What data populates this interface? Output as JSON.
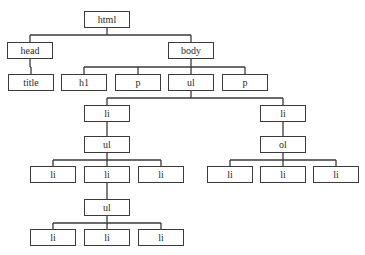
{
  "diagram": {
    "type": "tree",
    "title": "",
    "colors": {
      "stroke": "#3a3a3a",
      "fill": "#ffffff",
      "text": "#2a2a2a"
    },
    "nodes": [
      {
        "id": "html",
        "label": "html",
        "x": 84,
        "y": 11
      },
      {
        "id": "head",
        "label": "head",
        "x": 7,
        "y": 42
      },
      {
        "id": "body",
        "label": "body",
        "x": 168,
        "y": 42
      },
      {
        "id": "title",
        "label": "title",
        "x": 8,
        "y": 74
      },
      {
        "id": "h1",
        "label": "h1",
        "x": 61,
        "y": 74
      },
      {
        "id": "p1",
        "label": "p",
        "x": 115,
        "y": 74
      },
      {
        "id": "ul1",
        "label": "ul",
        "x": 168,
        "y": 74
      },
      {
        "id": "p2",
        "label": "p",
        "x": 222,
        "y": 74
      },
      {
        "id": "li_a",
        "label": "li",
        "x": 84,
        "y": 105
      },
      {
        "id": "li_b",
        "label": "li",
        "x": 260,
        "y": 105
      },
      {
        "id": "ul2",
        "label": "ul",
        "x": 84,
        "y": 136
      },
      {
        "id": "ol1",
        "label": "ol",
        "x": 260,
        "y": 136
      },
      {
        "id": "li_a1",
        "label": "li",
        "x": 30,
        "y": 166
      },
      {
        "id": "li_a2",
        "label": "li",
        "x": 84,
        "y": 166
      },
      {
        "id": "li_a3",
        "label": "li",
        "x": 138,
        "y": 166
      },
      {
        "id": "li_b1",
        "label": "li",
        "x": 207,
        "y": 166
      },
      {
        "id": "li_b2",
        "label": "li",
        "x": 260,
        "y": 166
      },
      {
        "id": "li_b3",
        "label": "li",
        "x": 313,
        "y": 166
      },
      {
        "id": "ul3",
        "label": "ul",
        "x": 84,
        "y": 199
      },
      {
        "id": "li_c1",
        "label": "li",
        "x": 30,
        "y": 229
      },
      {
        "id": "li_c2",
        "label": "li",
        "x": 84,
        "y": 229
      },
      {
        "id": "li_c3",
        "label": "li",
        "x": 138,
        "y": 229
      }
    ],
    "edges": [
      [
        "html",
        "head"
      ],
      [
        "html",
        "body"
      ],
      [
        "head",
        "title"
      ],
      [
        "body",
        "h1"
      ],
      [
        "body",
        "p1"
      ],
      [
        "body",
        "ul1"
      ],
      [
        "body",
        "p2"
      ],
      [
        "ul1",
        "li_a"
      ],
      [
        "ul1",
        "li_b"
      ],
      [
        "li_a",
        "ul2"
      ],
      [
        "li_b",
        "ol1"
      ],
      [
        "ul2",
        "li_a1"
      ],
      [
        "ul2",
        "li_a2"
      ],
      [
        "ul2",
        "li_a3"
      ],
      [
        "ol1",
        "li_b1"
      ],
      [
        "ol1",
        "li_b2"
      ],
      [
        "ol1",
        "li_b3"
      ],
      [
        "li_a2",
        "ul3"
      ],
      [
        "ul3",
        "li_c1"
      ],
      [
        "ul3",
        "li_c2"
      ],
      [
        "ul3",
        "li_c3"
      ]
    ]
  }
}
